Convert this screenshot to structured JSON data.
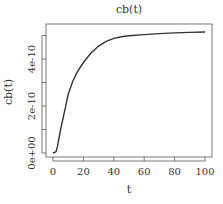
{
  "chart_data": {
    "type": "line",
    "title": "cb(t)",
    "xlabel": "t",
    "ylabel": "cb(t)",
    "xlim": [
      0,
      100
    ],
    "ylim": [
      0,
      5.2e-10
    ],
    "x_ticks": [
      0,
      20,
      40,
      60,
      80,
      100
    ],
    "x_tick_labels": [
      "0",
      "20",
      "40",
      "60",
      "80",
      "100"
    ],
    "y_ticks": [
      0,
      1e-10,
      2e-10,
      3e-10,
      4e-10,
      5e-10
    ],
    "y_tick_labels": [
      "0e+00",
      "",
      "2e-10",
      "",
      "4e-10",
      ""
    ],
    "grid": false,
    "legend": null,
    "series": [
      {
        "name": "cb(t)",
        "color": "#333333",
        "x": [
          0,
          2,
          3,
          5,
          8,
          10,
          13,
          16,
          20,
          25,
          30,
          35,
          40,
          45,
          50,
          60,
          70,
          80,
          90,
          100
        ],
        "values": [
          0,
          5e-12,
          3e-11,
          1e-10,
          1.9e-10,
          2.5e-10,
          3.05e-10,
          3.45e-10,
          3.85e-10,
          4.25e-10,
          4.55e-10,
          4.75e-10,
          4.88e-10,
          4.95e-10,
          4.99e-10,
          5.04e-10,
          5.08e-10,
          5.11e-10,
          5.13e-10,
          5.15e-10
        ]
      }
    ]
  }
}
